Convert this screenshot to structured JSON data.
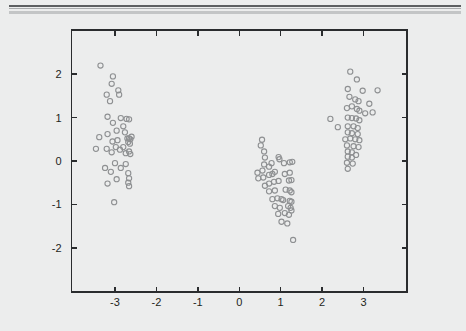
{
  "figure": {
    "width": 466,
    "height": 331,
    "background_color": "#eceded",
    "paper_color": "#ffffff"
  },
  "header_rules": {
    "dark_color": "#5d5f61",
    "thin_color": "#a9abad",
    "light_color": "#c3c5c6"
  },
  "chart_data": {
    "type": "scatter",
    "title": "",
    "subtitle": "",
    "xlabel": "",
    "ylabel": "",
    "xlim": [
      -4.05,
      4.05
    ],
    "ylim": [
      -3.02,
      3.02
    ],
    "xticks": [
      -3,
      -2,
      -1,
      0,
      1,
      2,
      3
    ],
    "yticks": [
      -2,
      -1,
      0,
      1,
      2
    ],
    "xtick_labels": [
      "-3",
      "-2",
      "-1",
      "0",
      "1",
      "2",
      "3"
    ],
    "ytick_labels": [
      "-2",
      "-1",
      "0",
      "1",
      "2"
    ],
    "grid": false,
    "legend": null,
    "marker": {
      "shape": "circle-open",
      "radius": 2.6,
      "stroke_color": "#8e9092",
      "stroke_width": 1.1,
      "fill": "none"
    },
    "frame": {
      "color": "#2a2c2e",
      "width": 1.6,
      "ticks_all_sides": true,
      "tick_direction": "in"
    },
    "series": [
      {
        "name": "cluster-left",
        "points": [
          [
            -3.35,
            2.2
          ],
          [
            -3.2,
            1.53
          ],
          [
            -3.05,
            1.95
          ],
          [
            -3.08,
            1.78
          ],
          [
            -3.12,
            1.38
          ],
          [
            -2.92,
            1.63
          ],
          [
            -2.9,
            1.53
          ],
          [
            -3.18,
            1.02
          ],
          [
            -3.05,
            0.88
          ],
          [
            -2.86,
            0.99
          ],
          [
            -2.72,
            0.97
          ],
          [
            -2.66,
            0.96
          ],
          [
            -3.38,
            0.55
          ],
          [
            -3.46,
            0.28
          ],
          [
            -3.18,
            0.62
          ],
          [
            -3.06,
            0.45
          ],
          [
            -2.96,
            0.7
          ],
          [
            -2.94,
            0.48
          ],
          [
            -2.8,
            0.8
          ],
          [
            -2.76,
            0.66
          ],
          [
            -2.7,
            0.52
          ],
          [
            -2.66,
            0.52
          ],
          [
            -2.63,
            0.5
          ],
          [
            -2.68,
            0.44
          ],
          [
            -2.64,
            0.4
          ],
          [
            -2.6,
            0.56
          ],
          [
            -3.2,
            0.28
          ],
          [
            -3.08,
            0.2
          ],
          [
            -2.98,
            0.32
          ],
          [
            -2.88,
            0.26
          ],
          [
            -2.8,
            0.32
          ],
          [
            -2.74,
            0.18
          ],
          [
            -2.66,
            0.22
          ],
          [
            -2.63,
            0.16
          ],
          [
            -3.24,
            -0.16
          ],
          [
            -3.1,
            -0.25
          ],
          [
            -3.0,
            -0.05
          ],
          [
            -2.86,
            -0.16
          ],
          [
            -2.74,
            -0.07
          ],
          [
            -2.68,
            -0.28
          ],
          [
            -2.66,
            -0.4
          ],
          [
            -3.18,
            -0.52
          ],
          [
            -2.96,
            -0.42
          ],
          [
            -2.68,
            -0.5
          ],
          [
            -2.66,
            -0.58
          ],
          [
            -3.02,
            -0.95
          ]
        ]
      },
      {
        "name": "cluster-middle",
        "points": [
          [
            0.55,
            0.49
          ],
          [
            0.52,
            0.36
          ],
          [
            0.6,
            0.22
          ],
          [
            0.62,
            0.08
          ],
          [
            0.95,
            0.09
          ],
          [
            0.97,
            0.04
          ],
          [
            0.44,
            -0.27
          ],
          [
            0.56,
            -0.22
          ],
          [
            0.6,
            -0.08
          ],
          [
            0.72,
            -0.13
          ],
          [
            0.78,
            -0.05
          ],
          [
            1.08,
            -0.05
          ],
          [
            1.22,
            -0.03
          ],
          [
            1.28,
            -0.02
          ],
          [
            0.46,
            -0.4
          ],
          [
            0.58,
            -0.38
          ],
          [
            0.72,
            -0.32
          ],
          [
            0.8,
            -0.3
          ],
          [
            0.86,
            -0.25
          ],
          [
            1.1,
            -0.3
          ],
          [
            1.22,
            -0.27
          ],
          [
            0.62,
            -0.57
          ],
          [
            0.72,
            -0.52
          ],
          [
            0.84,
            -0.48
          ],
          [
            0.95,
            -0.46
          ],
          [
            1.2,
            -0.45
          ],
          [
            1.26,
            -0.44
          ],
          [
            0.72,
            -0.7
          ],
          [
            0.86,
            -0.68
          ],
          [
            1.12,
            -0.66
          ],
          [
            1.22,
            -0.68
          ],
          [
            1.26,
            -0.72
          ],
          [
            0.8,
            -0.88
          ],
          [
            0.92,
            -0.86
          ],
          [
            1.02,
            -0.88
          ],
          [
            1.06,
            -0.9
          ],
          [
            1.22,
            -0.92
          ],
          [
            1.26,
            -0.94
          ],
          [
            0.86,
            -1.04
          ],
          [
            0.98,
            -1.08
          ],
          [
            1.18,
            -1.04
          ],
          [
            1.24,
            -1.08
          ],
          [
            1.26,
            -1.14
          ],
          [
            0.94,
            -1.22
          ],
          [
            1.1,
            -1.2
          ],
          [
            1.2,
            -1.24
          ],
          [
            1.02,
            -1.4
          ],
          [
            1.16,
            -1.44
          ],
          [
            1.3,
            -1.82
          ]
        ]
      },
      {
        "name": "cluster-right",
        "points": [
          [
            2.68,
            2.06
          ],
          [
            2.84,
            1.88
          ],
          [
            2.62,
            1.66
          ],
          [
            2.98,
            1.62
          ],
          [
            3.34,
            1.63
          ],
          [
            2.66,
            1.48
          ],
          [
            2.8,
            1.42
          ],
          [
            2.88,
            1.38
          ],
          [
            3.14,
            1.32
          ],
          [
            2.6,
            1.22
          ],
          [
            2.72,
            1.26
          ],
          [
            2.84,
            1.2
          ],
          [
            2.9,
            1.16
          ],
          [
            3.04,
            1.1
          ],
          [
            3.22,
            1.12
          ],
          [
            2.2,
            0.97
          ],
          [
            2.62,
            1.0
          ],
          [
            2.72,
            0.99
          ],
          [
            2.82,
            0.98
          ],
          [
            2.9,
            0.94
          ],
          [
            2.38,
            0.78
          ],
          [
            2.62,
            0.8
          ],
          [
            2.76,
            0.8
          ],
          [
            2.86,
            0.76
          ],
          [
            2.62,
            0.66
          ],
          [
            2.72,
            0.64
          ],
          [
            2.86,
            0.62
          ],
          [
            2.56,
            0.5
          ],
          [
            2.68,
            0.52
          ],
          [
            2.8,
            0.5
          ],
          [
            2.9,
            0.48
          ],
          [
            2.6,
            0.36
          ],
          [
            2.76,
            0.34
          ],
          [
            2.88,
            0.32
          ],
          [
            2.62,
            0.22
          ],
          [
            2.72,
            0.2
          ],
          [
            2.62,
            0.1
          ],
          [
            2.72,
            0.08
          ],
          [
            2.82,
            0.14
          ],
          [
            2.6,
            -0.04
          ],
          [
            2.74,
            -0.06
          ],
          [
            2.62,
            -0.18
          ]
        ]
      }
    ]
  }
}
